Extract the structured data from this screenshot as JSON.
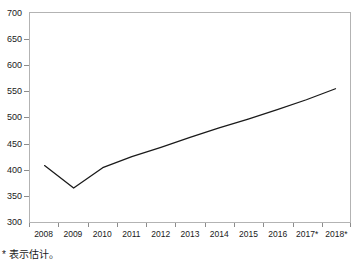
{
  "chart_data": {
    "type": "line",
    "title": "",
    "subtitle": "",
    "xlabel": "",
    "ylabel": "",
    "categories": [
      "2008",
      "2009",
      "2010",
      "2011",
      "2012",
      "2013",
      "2014",
      "2015",
      "2016",
      "2017*",
      "2018*"
    ],
    "values": [
      408,
      365,
      404,
      425,
      443,
      462,
      480,
      497,
      515,
      534,
      555
    ],
    "series": [
      {
        "name": "",
        "values": [
          408,
          365,
          404,
          425,
          443,
          462,
          480,
          497,
          515,
          534,
          555
        ]
      }
    ],
    "ylim": [
      300,
      700
    ],
    "yticks": [
      300,
      350,
      400,
      450,
      500,
      550,
      600,
      650,
      700
    ],
    "ytick_labels": [
      "300",
      "350",
      "400",
      "450",
      "500",
      "550",
      "600",
      "650",
      "700"
    ],
    "xtick_labels": [
      "2008",
      "2009",
      "2010",
      "2011",
      "2012",
      "2013",
      "2014",
      "2015",
      "2016",
      "2017*",
      "2018*"
    ],
    "grid": false,
    "legend": "none",
    "line_color": "#1a1a1a",
    "frame_color": "#b3b3b3",
    "background_color": "#ffffff",
    "annotations": [
      {
        "id": "estimate-footnote",
        "text": "* 表示估计。"
      }
    ]
  },
  "footnote": {
    "text": "* 表示估计。"
  }
}
